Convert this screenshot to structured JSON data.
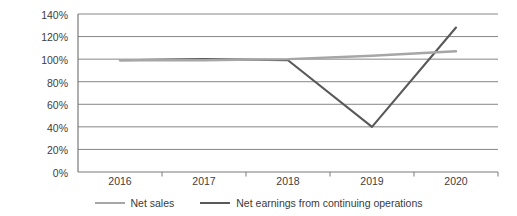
{
  "chart_data": {
    "type": "line",
    "title": "",
    "xlabel": "",
    "ylabel": "",
    "categories": [
      "2016",
      "2017",
      "2018",
      "2019",
      "2020"
    ],
    "ylim": [
      0,
      140
    ],
    "ytick_values": [
      0,
      20,
      40,
      60,
      80,
      100,
      120,
      140
    ],
    "ytick_labels": [
      "0%",
      "20%",
      "40%",
      "60%",
      "80%",
      "100%",
      "120%",
      "140%"
    ],
    "grid": "horizontal",
    "legend_position": "bottom",
    "series": [
      {
        "name": "Net sales",
        "color": "#a6a6a6",
        "values": [
          99,
          99,
          100,
          103,
          107
        ]
      },
      {
        "name": "Net earnings from continuing operations",
        "color": "#595959",
        "values": [
          99,
          100,
          99,
          40,
          128
        ]
      }
    ]
  },
  "axis": {
    "ytick_labels": [
      "140%",
      "120%",
      "100%",
      "80%",
      "60%",
      "40%",
      "20%",
      "0%"
    ],
    "xtick_labels": [
      "2016",
      "2017",
      "2018",
      "2019",
      "2020"
    ]
  },
  "legend": {
    "entries": [
      {
        "label": "Net sales",
        "color": "#a6a6a6"
      },
      {
        "label": "Net earnings from continuing operations",
        "color": "#595959"
      }
    ]
  },
  "colors": {
    "net_sales": "#a6a6a6",
    "net_earnings": "#595959",
    "gridline": "#808080",
    "axis": "#808080",
    "text": "#404040",
    "background": "#ffffff"
  }
}
